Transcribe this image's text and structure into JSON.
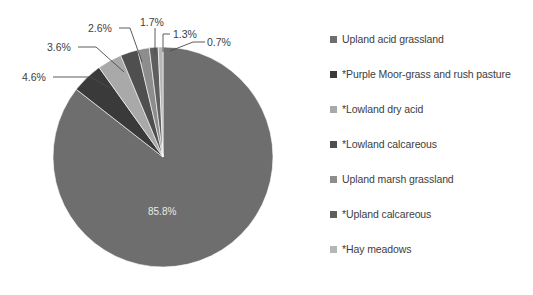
{
  "chart_data": {
    "type": "pie",
    "title": "",
    "subtitle": "",
    "xlabel": "",
    "ylabel": "",
    "legend_position": "right",
    "grid": false,
    "categories": [
      "Upland acid grassland",
      "*Purple Moor-grass and rush pasture",
      "*Lowland dry acid",
      "*Lowland calcareous",
      "Upland marsh grassland",
      "*Upland calcareous",
      "*Hay meadows"
    ],
    "values": [
      85.8,
      4.6,
      3.6,
      2.6,
      1.7,
      1.3,
      0.7
    ],
    "data_labels": [
      "85.8%",
      "4.6%",
      "3.6%",
      "2.6%",
      "1.7%",
      "1.3%",
      "0.7%"
    ],
    "colors": [
      "#6e6e6e",
      "#3a3a3a",
      "#a9a9a9",
      "#4f4f4f",
      "#8d8d8d",
      "#5e5e5e",
      "#b6b6b6"
    ],
    "units": "percent"
  },
  "legend": {
    "items": [
      {
        "label": "Upland acid grassland",
        "color": "#6e6e6e",
        "swatch_name": "legend-swatch-upland-acid-grassland"
      },
      {
        "label": "*Purple Moor-grass and rush pasture",
        "color": "#3a3a3a",
        "swatch_name": "legend-swatch-purple-moor-grass"
      },
      {
        "label": "*Lowland dry acid",
        "color": "#a9a9a9",
        "swatch_name": "legend-swatch-lowland-dry-acid"
      },
      {
        "label": "*Lowland calcareous",
        "color": "#4f4f4f",
        "swatch_name": "legend-swatch-lowland-calcareous"
      },
      {
        "label": "Upland marsh grassland",
        "color": "#8d8d8d",
        "swatch_name": "legend-swatch-upland-marsh-grassland"
      },
      {
        "label": "*Upland calcareous",
        "color": "#5e5e5e",
        "swatch_name": "legend-swatch-upland-calcareous"
      },
      {
        "label": "*Hay meadows",
        "color": "#b6b6b6",
        "swatch_name": "legend-swatch-hay-meadows"
      }
    ]
  },
  "callouts": {
    "l0": "85.8%",
    "l1": "4.6%",
    "l2": "3.6%",
    "l3": "2.6%",
    "l4": "1.7%",
    "l5": "1.3%",
    "l6": "0.7%"
  }
}
